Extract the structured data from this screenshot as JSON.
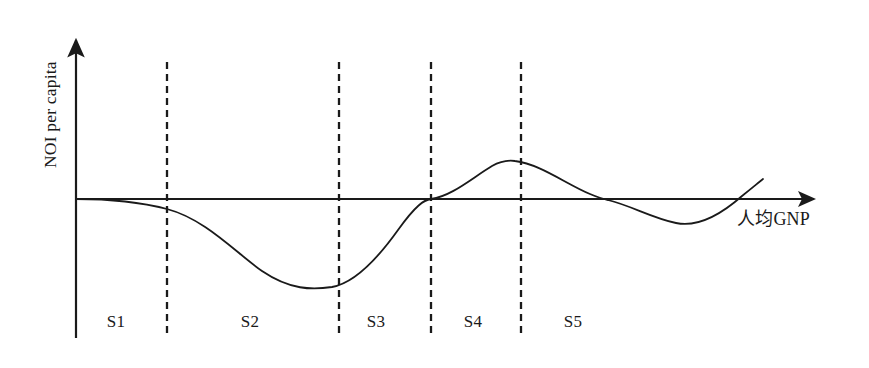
{
  "figure": {
    "axes": {
      "y_label": "NOI per capita",
      "x_label": "人均GNP",
      "origin": [
        76,
        199
      ],
      "x_axis_end": [
        822,
        199
      ],
      "y_axis_top": [
        76,
        32
      ]
    },
    "stage_labels": [
      {
        "name": "S1",
        "text": "S1",
        "x": 116,
        "y": 322
      },
      {
        "name": "S2",
        "text": "S2",
        "x": 250,
        "y": 322
      },
      {
        "name": "S3",
        "text": "S3",
        "x": 376,
        "y": 322
      },
      {
        "name": "S4",
        "text": "S4",
        "x": 473,
        "y": 322
      },
      {
        "name": "S5",
        "text": "S5",
        "x": 573,
        "y": 322
      }
    ],
    "dividers": [
      {
        "name": "divider-s1-s2",
        "x": 167,
        "y_top": 62,
        "y_bottom": 335
      },
      {
        "name": "divider-s2-s3",
        "x": 339,
        "y_top": 62,
        "y_bottom": 335
      },
      {
        "name": "divider-s3-s4",
        "x": 431,
        "y_top": 62,
        "y_bottom": 335
      },
      {
        "name": "divider-s4-s5",
        "x": 521,
        "y_top": 62,
        "y_bottom": 335
      }
    ],
    "stroke_color": "#1a1a1a",
    "curve_path": "M 76 199 C 110 199 140 202 167 209 C 205 219 235 252 262 271 C 290 290 312 290 332 287 C 355 283 378 258 398 230 C 416 205 424 200 431 199 C 452 196 472 178 492 166 C 501 161 508 160 515 161 C 540 164 566 184 590 194 C 597 197 603 199 608 200 C 632 206 652 218 676 223 C 700 228 725 211 742 196 C 752 188 758 183 763 179"
  },
  "chart_data": {
    "type": "line",
    "title": "",
    "xlabel": "人均GNP",
    "ylabel": "NOI per capita",
    "grid": false,
    "legend": false,
    "annotations": [
      "S1",
      "S2",
      "S3",
      "S4",
      "S5"
    ],
    "stage_boundaries_gnp": [
      0.0,
      0.13,
      0.36,
      0.48,
      0.6,
      1.0
    ],
    "stages": [
      {
        "label": "S1",
        "noi_trend": "flat, slightly below zero",
        "noi_sign": "~0"
      },
      {
        "label": "S2",
        "noi_trend": "declining sharply to minimum",
        "noi_sign": "negative"
      },
      {
        "label": "S3",
        "noi_trend": "rising from minimum to zero crossing",
        "noi_sign": "negative rising to zero"
      },
      {
        "label": "S4",
        "noi_trend": "rising to positive peak",
        "noi_sign": "positive"
      },
      {
        "label": "S5",
        "noi_trend": "oscillating around zero",
        "noi_sign": "fluctuating around zero"
      }
    ],
    "x": [
      0.0,
      0.12,
      0.24,
      0.34,
      0.43,
      0.48,
      0.55,
      0.59,
      0.65,
      0.71,
      0.76,
      0.8,
      0.86,
      0.92,
      0.97
    ],
    "y": [
      0.0,
      -0.11,
      -0.63,
      -0.88,
      -0.54,
      0.0,
      0.33,
      0.39,
      0.27,
      0.12,
      -0.02,
      -0.17,
      -0.26,
      -0.05,
      0.2
    ],
    "ylim": [
      -1.1,
      0.7
    ],
    "xlim": [
      0,
      1
    ],
    "zero_crossings_x": [
      0.476,
      0.713,
      0.883
    ],
    "minimum": {
      "x": 0.343,
      "y": -0.88
    },
    "maximum": {
      "x": 0.588,
      "y": 0.39
    },
    "secondary_minimum": {
      "x": 0.805,
      "y": -0.26
    }
  }
}
